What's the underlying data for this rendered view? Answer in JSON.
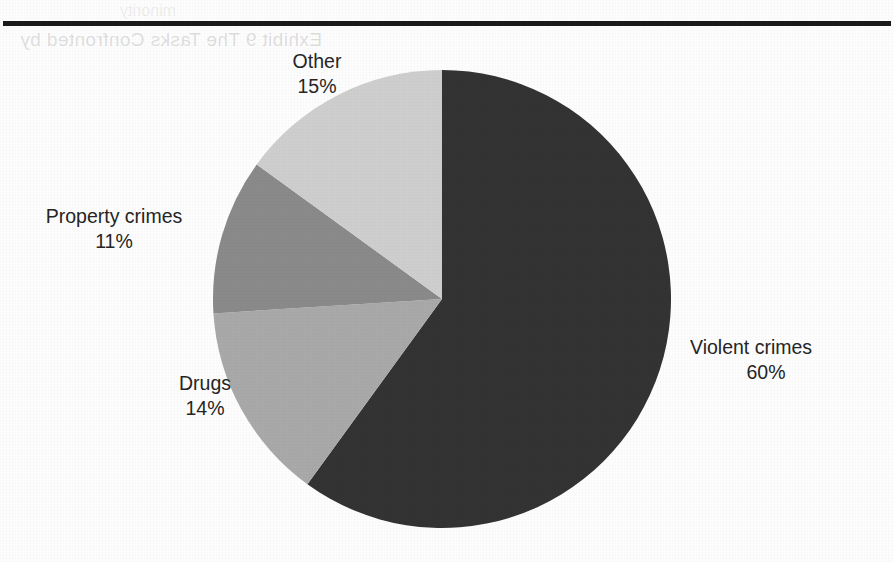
{
  "page": {
    "bleed_text_top": "Exhibit 9 The Tasks Confronted by",
    "bleed_text_faint": "minority"
  },
  "chart_data": {
    "type": "pie",
    "title": "",
    "subtitle": "",
    "xlabel": "",
    "ylabel": "",
    "legend_position": "none",
    "grid": false,
    "start_angle_deg": 0,
    "direction": "clockwise",
    "categories": [
      "Violent crimes",
      "Drugs",
      "Property crimes",
      "Other"
    ],
    "values": [
      60,
      14,
      11,
      15
    ],
    "value_unit": "%",
    "colors": [
      "#333333",
      "#a9a9a9",
      "#8a8a8a",
      "#cecece"
    ],
    "slices": [
      {
        "label": "Violent crimes",
        "value": 60,
        "display": "60%",
        "color": "#333333"
      },
      {
        "label": "Drugs",
        "value": 14,
        "display": "14%",
        "color": "#a9a9a9"
      },
      {
        "label": "Property crimes",
        "value": 11,
        "display": "11%",
        "color": "#8a8a8a"
      },
      {
        "label": "Other",
        "value": 15,
        "display": "15%",
        "color": "#cecece"
      }
    ]
  }
}
